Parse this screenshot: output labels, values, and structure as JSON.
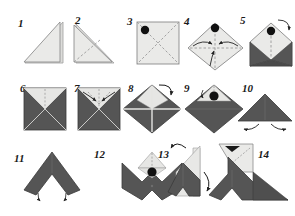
{
  "document": {
    "type": "origami-instruction-diagram",
    "title": "Origami folding sequence",
    "total_steps": 14,
    "rows": 3,
    "columns": 5,
    "background_color": "#ffffff"
  },
  "palette": {
    "paper_light": "#e8e8e6",
    "paper_light_alt": "#efefed",
    "paper_dark": "#4f4f4f",
    "paper_dark_alt": "#5a5a5a",
    "outline": "#8a8a8a",
    "outline_dark": "#3a3a3a",
    "crease_dash": "#9a9a9a",
    "marker_dot": "#111111",
    "arrow": "#222222",
    "number_color": "#1a1a1a"
  },
  "steps": [
    {
      "number": "1",
      "label": "Triangle folded, right angle at bottom right",
      "shape": "right-triangle",
      "fill": "light",
      "has_dot": false,
      "has_crease": false,
      "arrows": 0
    },
    {
      "number": "2",
      "label": "Triangle with diagonal crease, right angle at bottom left",
      "shape": "right-triangle-mirrored",
      "fill": "light",
      "has_dot": false,
      "has_crease": true,
      "arrows": 0
    },
    {
      "number": "3",
      "label": "Open square with X diagonals and corner marker",
      "shape": "square",
      "fill": "light",
      "has_dot": true,
      "dot_position": "top-left",
      "has_crease": true,
      "arrows": 0
    },
    {
      "number": "4",
      "label": "Square rotated to diamond, fold side corners to center",
      "shape": "diamond",
      "fill": "light",
      "has_dot": true,
      "dot_position": "top",
      "has_crease": true,
      "arrows": 3
    },
    {
      "number": "5",
      "label": "Envelope form with dark flaps, flip over",
      "shape": "envelope",
      "fill": "mixed",
      "has_dot": true,
      "dot_position": "top",
      "has_crease": true,
      "arrows": 1
    },
    {
      "number": "6",
      "label": "Square with four triangles meeting at center",
      "shape": "square-pinwheel",
      "fill": "mixed",
      "has_dot": false,
      "has_crease": true,
      "arrows": 0
    },
    {
      "number": "7",
      "label": "Fold upper flap corners inward",
      "shape": "square-pinwheel",
      "fill": "mixed",
      "has_dot": false,
      "has_crease": true,
      "arrows": 2
    },
    {
      "number": "8",
      "label": "Diamond orientation, turn the model over",
      "shape": "diamond-quartered",
      "fill": "mixed",
      "has_dot": false,
      "has_crease": true,
      "arrows": 1
    },
    {
      "number": "9",
      "label": "Diamond with marker dot visible, fold down",
      "shape": "diamond-flap",
      "fill": "mixed",
      "has_dot": true,
      "dot_position": "upper-center",
      "has_crease": true,
      "arrows": 1
    },
    {
      "number": "10",
      "label": "Flattened triangle, pull wings outward",
      "shape": "triangle-up",
      "fill": "dark",
      "has_dot": false,
      "has_crease": false,
      "arrows": 2
    },
    {
      "number": "11",
      "label": "Chevron wing form, fold legs",
      "shape": "chevron",
      "fill": "dark",
      "has_dot": false,
      "has_crease": false,
      "arrows": 2
    },
    {
      "number": "12",
      "label": "Bat shape with light head flap and marker dot",
      "shape": "bat",
      "fill": "mixed",
      "has_dot": true,
      "dot_position": "head",
      "has_crease": true,
      "arrows": 0
    },
    {
      "number": "13",
      "label": "Side view, rotate and fold the neck",
      "shape": "side-chevron",
      "fill": "mixed",
      "has_dot": false,
      "has_crease": false,
      "arrows": 2
    },
    {
      "number": "14",
      "label": "Finished bird with head and eye",
      "shape": "bird-final",
      "fill": "mixed",
      "has_dot": true,
      "dot_position": "eye",
      "has_crease": true,
      "arrows": 0
    }
  ]
}
